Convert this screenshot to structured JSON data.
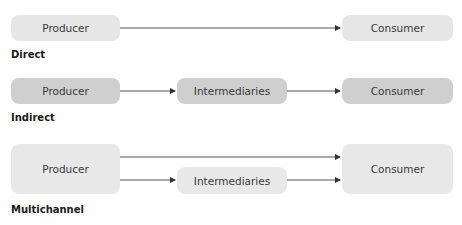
{
  "diagrams": {
    "direct": {
      "label": "Direct",
      "producer": "Producer",
      "consumer": "Consumer"
    },
    "indirect": {
      "label": "Indirect",
      "producer": "Producer",
      "intermediaries": "Intermediaries",
      "consumer": "Consumer"
    },
    "multichannel": {
      "label": "Multichannel",
      "producer": "Producer",
      "intermediaries": "Intermediaries",
      "consumer": "Consumer"
    }
  },
  "colors": {
    "direct_box": "#e6e6e6",
    "indirect_box": "#cfcfcf",
    "multichannel_box": "#e8e8e8",
    "arrow": "#333333"
  }
}
